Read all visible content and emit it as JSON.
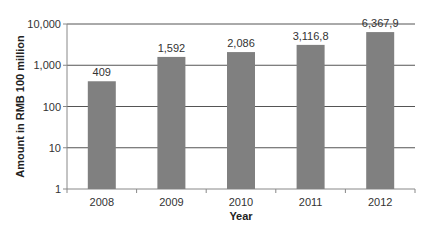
{
  "chart_data": {
    "type": "bar",
    "title": "",
    "xlabel": "Year",
    "ylabel": "Amount in RMB 100 million",
    "yscale": "log",
    "ylim": [
      1,
      10000
    ],
    "yticks": [
      1,
      10,
      100,
      1000,
      10000
    ],
    "ytick_labels": [
      "1",
      "10",
      "100",
      "1,000",
      "10,000"
    ],
    "categories": [
      "2008",
      "2009",
      "2010",
      "2011",
      "2012"
    ],
    "values": [
      409,
      1592,
      2086,
      3116.8,
      6367.9
    ],
    "data_labels": [
      "409",
      "1,592",
      "2,086",
      "3,116,8",
      "6,367,9"
    ],
    "grid": "horizontal",
    "legend": null,
    "colors": {
      "bar": "#808080",
      "grid": "#555555",
      "axis": "#888888"
    }
  }
}
